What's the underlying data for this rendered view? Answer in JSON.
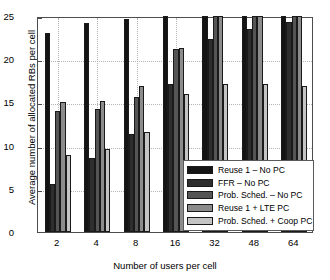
{
  "chart_data": {
    "type": "bar",
    "title": "",
    "xlabel": "Number of users per cell",
    "ylabel": "Average number of allocated RBs per cell",
    "categories": [
      "2",
      "4",
      "8",
      "16",
      "32",
      "48",
      "64"
    ],
    "ylim": [
      0,
      25
    ],
    "yticks": [
      "0",
      "5",
      "10",
      "15",
      "20",
      "25"
    ],
    "grid": true,
    "legend_position": "lower right",
    "series": [
      {
        "name": "Reuse 1 – No PC",
        "color": "#141414",
        "values": [
          23.0,
          24.2,
          24.7,
          25.0,
          25.0,
          25.0,
          25.0
        ]
      },
      {
        "name": "FFR – No PC",
        "color": "#2e2e2e",
        "values": [
          5.6,
          8.6,
          11.4,
          17.1,
          22.3,
          23.5,
          24.3
        ]
      },
      {
        "name": "Prob. Sched. – No PC",
        "color": "#555555",
        "values": [
          14.0,
          14.2,
          15.6,
          21.2,
          25.0,
          25.0,
          25.0
        ]
      },
      {
        "name": "Reuse 1 + LTE PC",
        "color": "#8c8c8c",
        "values": [
          15.1,
          15.2,
          16.9,
          21.3,
          25.0,
          25.0,
          25.0
        ]
      },
      {
        "name": "Prob. Sched. + Coop PC",
        "color": "#c4c4c4",
        "values": [
          8.9,
          9.6,
          11.6,
          16.0,
          17.1,
          17.1,
          16.9
        ]
      }
    ]
  }
}
